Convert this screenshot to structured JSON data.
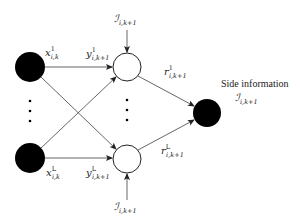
{
  "diagram": {
    "type": "network",
    "colors": {
      "source_fill": "#000000",
      "relay_fill": "#ffffff",
      "relay_stroke": "#222222",
      "sink_fill": "#000000",
      "edge": "#555555"
    },
    "nodes": {
      "sources": [
        {
          "id": "source-1",
          "kind": "filled"
        },
        {
          "id": "source-L",
          "kind": "filled"
        }
      ],
      "relays": [
        {
          "id": "relay-1",
          "kind": "hollow"
        },
        {
          "id": "relay-L",
          "kind": "hollow"
        }
      ],
      "sink": {
        "id": "sink",
        "kind": "filled"
      }
    },
    "labels": {
      "x1": {
        "base": "x",
        "sup": "1",
        "sub": "i,k"
      },
      "xL": {
        "base": "x",
        "sup": "L",
        "sub": "i,k"
      },
      "y1": {
        "base": "y",
        "sup": "1",
        "sub": "i,k+1"
      },
      "yL": {
        "base": "y",
        "sup": "L",
        "sub": "i,k+1"
      },
      "r1": {
        "base": "r",
        "sup": "1",
        "sub": "i,k+1"
      },
      "rL": {
        "base": "r",
        "sup": "L",
        "sub": "i,k+1"
      },
      "I_top": {
        "base": "ℐ",
        "sub": "i,k+1"
      },
      "I_bottom": {
        "base": "ℐ",
        "sub": "i,k+1"
      },
      "I_side": {
        "base": "ℐ",
        "sub": "i,k+1"
      }
    },
    "side_information_title": "Side information",
    "ellipsis": "⋮"
  }
}
